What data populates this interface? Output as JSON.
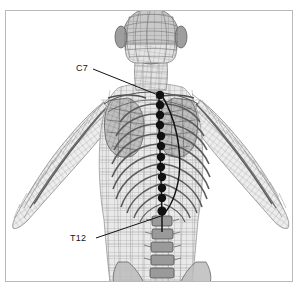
{
  "figure": {
    "view": "posterior",
    "background_color": "#ffffff",
    "frame_color": "#b9b9b9",
    "marker_color": "#111111",
    "mesh_color": "#8a8a8a",
    "bone_color": "#6f6f6f"
  },
  "annotations": {
    "c7": {
      "label": "C7",
      "description": "seventh cervical vertebra marker",
      "text_x": 76,
      "text_y": 64,
      "leader_from": [
        93,
        69
      ],
      "leader_to": [
        158,
        95
      ]
    },
    "t12": {
      "label": "T12",
      "description": "twelfth thoracic vertebra marker",
      "text_x": 70,
      "text_y": 234,
      "leader_from": [
        96,
        238
      ],
      "leader_to": [
        161,
        216
      ]
    }
  },
  "spine_markers": {
    "count": 12,
    "names": [
      "C7",
      "T1",
      "T2",
      "T3",
      "T4",
      "T5",
      "T6",
      "T7",
      "T8",
      "T9",
      "T10",
      "T12"
    ],
    "points": [
      [
        160,
        95
      ],
      [
        160,
        105
      ],
      [
        160,
        115
      ],
      [
        160,
        125
      ],
      [
        161,
        136
      ],
      [
        161,
        146
      ],
      [
        161,
        157
      ],
      [
        161,
        167
      ],
      [
        162,
        177
      ],
      [
        162,
        188
      ],
      [
        162,
        198
      ],
      [
        162,
        211
      ]
    ],
    "radius": 4.2
  },
  "spine_curves": [
    {
      "name": "spinous-process-line",
      "path": "M 159,92 L 159,120 L 160,150 L 161,180 L 162,215 L 162,232"
    },
    {
      "name": "lateral-spine-contour",
      "path": "M 161,94 C 176,118 182,150 179,176 C 176,198 168,210 162,216"
    }
  ],
  "anatomy_parts": [
    "head",
    "neck",
    "left-shoulder",
    "right-shoulder",
    "left-arm",
    "right-arm",
    "scapula-left",
    "scapula-right",
    "rib-cage",
    "thoracic-spine",
    "lumbar-spine",
    "pelvis"
  ]
}
